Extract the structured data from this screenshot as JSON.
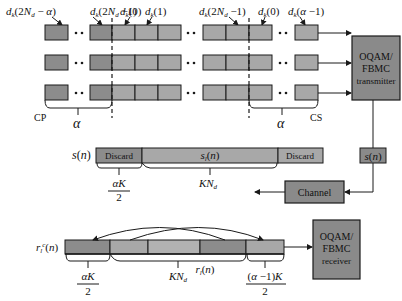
{
  "colors": {
    "cell_dark": "#8c8c8c",
    "cell_light": "#a8a8a8",
    "block_fill": "#8a8a8a",
    "stroke": "#1a1a1a"
  },
  "top_labels": {
    "l1": "d_k(2N_d − α)",
    "l2": "d_k(2N_d − 1)",
    "l3": "d_k(0)",
    "l4": "d_k(1)",
    "l5": "d_k(2N_d − 1)",
    "l6": "d_k(0)",
    "l7": "d_k(α − 1)"
  },
  "brackets": {
    "cp_label": "CP",
    "cs_label": "CS",
    "alpha_left": "α",
    "alpha_right": "α"
  },
  "transmitter": {
    "line1": "OQAM/",
    "line2": "FBMC",
    "line3": "transmitter"
  },
  "signal_box": "s(n)",
  "channel": "Channel",
  "s_bar": {
    "label": "s(n)",
    "discard_left": "Discard",
    "middle": "s_l(n)",
    "discard_right": "Discard",
    "under_left_num": "αK",
    "under_left_den": "2",
    "under_mid": "KN_d"
  },
  "r_bar": {
    "label": "r_l^c(n)",
    "under_left_num": "αK",
    "under_left_den": "2",
    "under_mid": "KN_d",
    "mid_label": "r_l(n)",
    "under_right_num": "(α − 1)K",
    "under_right_den": "2"
  },
  "receiver": {
    "line1": "OQAM/",
    "line2": "FBMC",
    "line3": "receiver"
  }
}
